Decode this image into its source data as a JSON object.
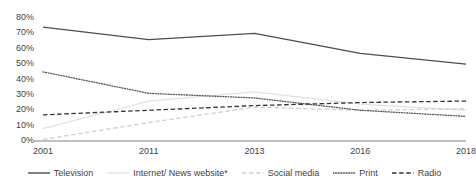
{
  "chart_data": {
    "type": "line",
    "title": "",
    "subtitle": "",
    "xlabel": "",
    "ylabel": "",
    "categories": [
      "2001",
      "2011",
      "2013",
      "2016",
      "2018"
    ],
    "ylim": [
      0,
      80
    ],
    "ytick_labels": [
      "0%",
      "10%",
      "20%",
      "30%",
      "40%",
      "50%",
      "60%",
      "70%",
      "80%"
    ],
    "ytick_values": [
      0,
      10,
      20,
      30,
      40,
      50,
      60,
      70,
      80
    ],
    "grid": false,
    "legend_position": "bottom",
    "series": [
      {
        "name": "Television",
        "style": "solid",
        "color": "#4d4d4d",
        "values": [
          74,
          66,
          70,
          57,
          50
        ]
      },
      {
        "name": "Internet/ News website*",
        "style": "solid",
        "color": "#e2e2e2",
        "values": [
          8,
          26,
          32,
          24,
          20
        ]
      },
      {
        "name": "Social media",
        "style": "dashed",
        "color": "#d0d0d0",
        "values": [
          1,
          12,
          22,
          20,
          21
        ]
      },
      {
        "name": "Print",
        "style": "dotted",
        "color": "#595959",
        "values": [
          45,
          31,
          28,
          20,
          16
        ]
      },
      {
        "name": "Radio",
        "style": "dashed",
        "color": "#333333",
        "values": [
          17,
          20,
          23,
          25,
          26
        ]
      }
    ]
  },
  "legend": {
    "items": [
      {
        "label": "Television",
        "marker": "solid-line-icon"
      },
      {
        "label": "Internet/ News website*",
        "marker": "solid-faint-line-icon"
      },
      {
        "label": "Social media",
        "marker": "dashed-faint-line-icon"
      },
      {
        "label": "Print",
        "marker": "dotted-line-icon"
      },
      {
        "label": "Radio",
        "marker": "dashed-line-icon"
      }
    ]
  }
}
